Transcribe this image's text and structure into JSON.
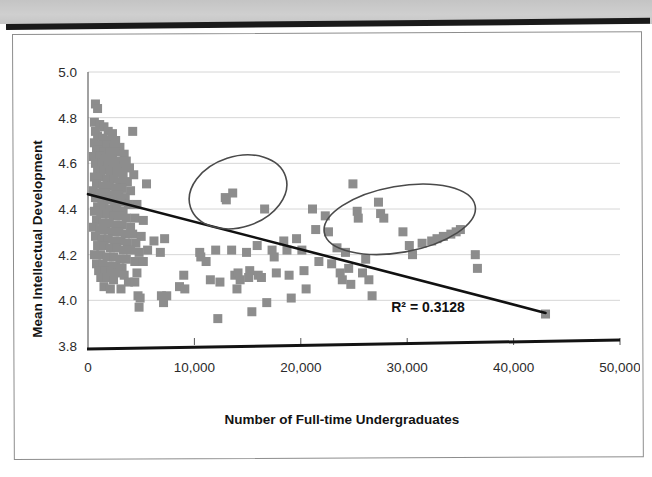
{
  "page": {
    "background_color": "#ffffff",
    "top_band_color": "#c9c9c9",
    "rule_color": "#1a1a1a",
    "border_color": "#8d8d8d"
  },
  "chart_data": {
    "type": "scatter",
    "title": "",
    "xlabel": "Number of Full-time Undergraduates",
    "ylabel": "Mean Intellectual Development",
    "xlim": [
      0,
      50000
    ],
    "ylim": [
      3.8,
      5.0
    ],
    "xticks": [
      0,
      10000,
      20000,
      30000,
      40000,
      50000
    ],
    "xticklabels": [
      "0",
      "10,000",
      "20,000",
      "30,000",
      "40,000",
      "50,000"
    ],
    "yticks": [
      3.8,
      4.0,
      4.2,
      4.4,
      4.6,
      4.8,
      5.0
    ],
    "yticklabels": [
      "3.8",
      "4.0",
      "4.2",
      "4.4",
      "4.6",
      "4.8",
      "5.0"
    ],
    "grid": "horizontal",
    "gridline_color": "#d6d6d6",
    "legend": "none",
    "marker": {
      "shape": "square",
      "color": "#8d8d8d",
      "size_px": 9
    },
    "trendline": {
      "type": "linear",
      "color": "#111111",
      "width_px": 2.6,
      "x_start": 0,
      "y_start": 4.465,
      "x_end": 43000,
      "y_end": 3.945,
      "r_squared_label": "R² = 0.3128",
      "r_squared_value": 0.3128
    },
    "annotations": [
      {
        "name": "ellipse-cluster-left",
        "shape": "ellipse",
        "stroke": "#4a4a4a",
        "x_center": 14100,
        "y_center": 4.475,
        "x_radius": 4700,
        "y_radius": 0.155,
        "rotation_deg": -18
      },
      {
        "name": "ellipse-cluster-right",
        "shape": "ellipse",
        "stroke": "#4a4a4a",
        "x_center": 29300,
        "y_center": 4.355,
        "x_radius": 7200,
        "y_radius": 0.145,
        "rotation_deg": -10
      }
    ],
    "points": [
      [
        700,
        4.86
      ],
      [
        900,
        4.84
      ],
      [
        600,
        4.78
      ],
      [
        1100,
        4.77
      ],
      [
        1500,
        4.76
      ],
      [
        700,
        4.74
      ],
      [
        1900,
        4.74
      ],
      [
        2300,
        4.73
      ],
      [
        4200,
        4.74
      ],
      [
        900,
        4.72
      ],
      [
        1400,
        4.71
      ],
      [
        2000,
        4.7
      ],
      [
        2600,
        4.7
      ],
      [
        600,
        4.69
      ],
      [
        1200,
        4.68
      ],
      [
        1800,
        4.68
      ],
      [
        2400,
        4.67
      ],
      [
        3000,
        4.67
      ],
      [
        800,
        4.66
      ],
      [
        1500,
        4.65
      ],
      [
        2100,
        4.65
      ],
      [
        2800,
        4.65
      ],
      [
        3400,
        4.64
      ],
      [
        500,
        4.63
      ],
      [
        1100,
        4.63
      ],
      [
        1700,
        4.62
      ],
      [
        2300,
        4.62
      ],
      [
        2900,
        4.61
      ],
      [
        3600,
        4.61
      ],
      [
        700,
        4.6
      ],
      [
        1300,
        4.6
      ],
      [
        1900,
        4.59
      ],
      [
        2500,
        4.59
      ],
      [
        3100,
        4.58
      ],
      [
        3900,
        4.58
      ],
      [
        900,
        4.57
      ],
      [
        1500,
        4.57
      ],
      [
        2100,
        4.56
      ],
      [
        2700,
        4.56
      ],
      [
        3300,
        4.55
      ],
      [
        4300,
        4.55
      ],
      [
        600,
        4.54
      ],
      [
        1200,
        4.54
      ],
      [
        1800,
        4.53
      ],
      [
        2400,
        4.53
      ],
      [
        3000,
        4.52
      ],
      [
        3700,
        4.52
      ],
      [
        5500,
        4.51
      ],
      [
        800,
        4.51
      ],
      [
        1400,
        4.5
      ],
      [
        2000,
        4.5
      ],
      [
        2600,
        4.49
      ],
      [
        3200,
        4.49
      ],
      [
        4000,
        4.48
      ],
      [
        500,
        4.48
      ],
      [
        1100,
        4.47
      ],
      [
        1700,
        4.47
      ],
      [
        2300,
        4.46
      ],
      [
        2900,
        4.46
      ],
      [
        3500,
        4.45
      ],
      [
        700,
        4.45
      ],
      [
        1300,
        4.44
      ],
      [
        1900,
        4.44
      ],
      [
        2500,
        4.43
      ],
      [
        3100,
        4.43
      ],
      [
        3800,
        4.42
      ],
      [
        4600,
        4.42
      ],
      [
        900,
        4.41
      ],
      [
        1500,
        4.41
      ],
      [
        2100,
        4.4
      ],
      [
        2700,
        4.4
      ],
      [
        3300,
        4.39
      ],
      [
        600,
        4.39
      ],
      [
        1200,
        4.38
      ],
      [
        1800,
        4.38
      ],
      [
        2400,
        4.37
      ],
      [
        3000,
        4.37
      ],
      [
        3600,
        4.36
      ],
      [
        4400,
        4.36
      ],
      [
        5200,
        4.35
      ],
      [
        800,
        4.35
      ],
      [
        1400,
        4.34
      ],
      [
        2000,
        4.34
      ],
      [
        2600,
        4.33
      ],
      [
        3200,
        4.33
      ],
      [
        4000,
        4.32
      ],
      [
        500,
        4.32
      ],
      [
        1100,
        4.31
      ],
      [
        1700,
        4.31
      ],
      [
        2300,
        4.3
      ],
      [
        2900,
        4.3
      ],
      [
        3500,
        4.29
      ],
      [
        4200,
        4.29
      ],
      [
        5000,
        4.28
      ],
      [
        700,
        4.28
      ],
      [
        1300,
        4.27
      ],
      [
        1900,
        4.27
      ],
      [
        2500,
        4.26
      ],
      [
        3100,
        4.26
      ],
      [
        3700,
        4.25
      ],
      [
        4500,
        4.25
      ],
      [
        6200,
        4.26
      ],
      [
        7200,
        4.27
      ],
      [
        900,
        4.24
      ],
      [
        1500,
        4.24
      ],
      [
        2100,
        4.23
      ],
      [
        2700,
        4.23
      ],
      [
        3300,
        4.22
      ],
      [
        4000,
        4.22
      ],
      [
        4800,
        4.21
      ],
      [
        5600,
        4.22
      ],
      [
        6800,
        4.21
      ],
      [
        600,
        4.2
      ],
      [
        1200,
        4.2
      ],
      [
        1800,
        4.19
      ],
      [
        2400,
        4.19
      ],
      [
        3000,
        4.18
      ],
      [
        3600,
        4.18
      ],
      [
        4400,
        4.17
      ],
      [
        5200,
        4.17
      ],
      [
        800,
        4.16
      ],
      [
        1400,
        4.16
      ],
      [
        2000,
        4.15
      ],
      [
        2600,
        4.15
      ],
      [
        3200,
        4.14
      ],
      [
        1000,
        4.13
      ],
      [
        1600,
        4.13
      ],
      [
        2200,
        4.12
      ],
      [
        2800,
        4.12
      ],
      [
        3400,
        4.11
      ],
      [
        4600,
        4.12
      ],
      [
        1200,
        4.1
      ],
      [
        1800,
        4.1
      ],
      [
        2400,
        4.09
      ],
      [
        3800,
        4.08
      ],
      [
        4400,
        4.08
      ],
      [
        1500,
        4.06
      ],
      [
        2100,
        4.05
      ],
      [
        3100,
        4.05
      ],
      [
        4700,
        4.02
      ],
      [
        4900,
        4.01
      ],
      [
        4800,
        3.97
      ],
      [
        6900,
        4.02
      ],
      [
        7400,
        4.02
      ],
      [
        7100,
        3.99
      ],
      [
        8600,
        4.06
      ],
      [
        9100,
        4.05
      ],
      [
        9000,
        4.11
      ],
      [
        10500,
        4.21
      ],
      [
        10600,
        4.19
      ],
      [
        11100,
        4.17
      ],
      [
        11500,
        4.09
      ],
      [
        12000,
        4.22
      ],
      [
        12400,
        4.08
      ],
      [
        12200,
        3.92
      ],
      [
        12900,
        4.45
      ],
      [
        13000,
        4.44
      ],
      [
        13600,
        4.47
      ],
      [
        13500,
        4.22
      ],
      [
        13800,
        4.11
      ],
      [
        14100,
        4.12
      ],
      [
        14300,
        4.09
      ],
      [
        14000,
        4.05
      ],
      [
        14900,
        4.21
      ],
      [
        15200,
        4.13
      ],
      [
        15100,
        4.1
      ],
      [
        15400,
        3.95
      ],
      [
        15900,
        4.24
      ],
      [
        16000,
        4.11
      ],
      [
        16300,
        4.1
      ],
      [
        16600,
        4.4
      ],
      [
        16800,
        3.99
      ],
      [
        17300,
        4.22
      ],
      [
        17500,
        4.19
      ],
      [
        17700,
        4.12
      ],
      [
        18400,
        4.26
      ],
      [
        18700,
        4.22
      ],
      [
        18900,
        4.11
      ],
      [
        19100,
        4.01
      ],
      [
        19600,
        4.27
      ],
      [
        20100,
        4.22
      ],
      [
        20300,
        4.13
      ],
      [
        20500,
        4.05
      ],
      [
        21100,
        4.4
      ],
      [
        21400,
        4.31
      ],
      [
        21700,
        4.17
      ],
      [
        22300,
        4.37
      ],
      [
        22600,
        4.3
      ],
      [
        22900,
        4.16
      ],
      [
        23400,
        4.23
      ],
      [
        23700,
        4.12
      ],
      [
        23900,
        4.09
      ],
      [
        24200,
        4.21
      ],
      [
        24500,
        4.14
      ],
      [
        24700,
        4.07
      ],
      [
        24900,
        4.51
      ],
      [
        25300,
        4.39
      ],
      [
        25400,
        4.36
      ],
      [
        25800,
        4.12
      ],
      [
        26100,
        4.18
      ],
      [
        26400,
        4.09
      ],
      [
        26700,
        4.02
      ],
      [
        27300,
        4.43
      ],
      [
        27500,
        4.38
      ],
      [
        27800,
        4.36
      ],
      [
        29600,
        4.3
      ],
      [
        30200,
        4.24
      ],
      [
        30500,
        4.2
      ],
      [
        31400,
        4.25
      ],
      [
        32300,
        4.26
      ],
      [
        32800,
        4.27
      ],
      [
        33400,
        4.28
      ],
      [
        34100,
        4.29
      ],
      [
        34600,
        4.3
      ],
      [
        35000,
        4.31
      ],
      [
        36400,
        4.2
      ],
      [
        36600,
        4.14
      ],
      [
        43000,
        3.94
      ]
    ]
  }
}
